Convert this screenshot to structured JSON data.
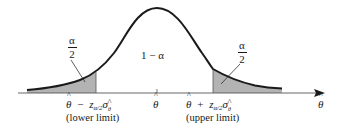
{
  "figure": {
    "type": "normal-distribution-confidence-interval",
    "curve_color": "#1a1a1a",
    "shade_color": "#b3b3b3",
    "axis_color": "#555555",
    "center_label": "1 − α",
    "tail_labels": {
      "left": {
        "numerator": "α",
        "denominator": "2"
      },
      "right": {
        "numerator": "α",
        "denominator": "2"
      }
    },
    "axis": {
      "variable": "θ",
      "center_tick": "θ",
      "lower": {
        "estimate": "θ",
        "operator": "−",
        "z": "z",
        "z_sub": "α/2",
        "sigma": "σ",
        "sigma_sub": "θ",
        "caption": "(lower limit)"
      },
      "upper": {
        "estimate": "θ",
        "operator": "+",
        "z": "z",
        "z_sub": "α/2",
        "sigma": "σ",
        "sigma_sub": "θ",
        "caption": "(upper limit)"
      }
    }
  }
}
